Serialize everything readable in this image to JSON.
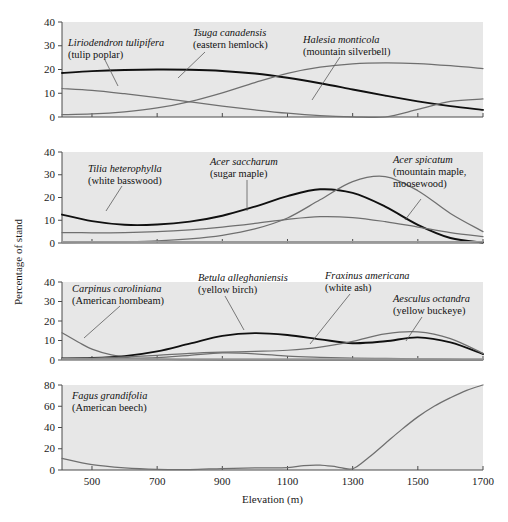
{
  "figure": {
    "xlabel": "Elevation (m)",
    "ylabel": "Percentage of stand"
  },
  "chart_data": {
    "type": "line",
    "title": "",
    "xlabel": "Elevation (m)",
    "ylabel": "Percentage of stand",
    "xlim": [
      408,
      1700
    ],
    "xticks": [
      500,
      700,
      900,
      1100,
      1300,
      1500,
      1700
    ],
    "grid": false,
    "legend_position": "inline-annotations",
    "panels": [
      {
        "index": 1,
        "ylim": [
          0,
          40
        ],
        "yticks": [
          0,
          10,
          20,
          30,
          40
        ],
        "series": [
          {
            "name": "Liriodendron tulipifera",
            "common": "tulip poplar",
            "style": "thick-black",
            "x": [
              408,
              500,
              600,
              700,
              800,
              900,
              1000,
              1100,
              1200,
              1300,
              1400,
              1500,
              1600,
              1700
            ],
            "values": [
              18.5,
              19.3,
              19.8,
              20.0,
              19.9,
              19.4,
              18.3,
              16.5,
              14.2,
              11.6,
              9.0,
              6.6,
              4.6,
              3.0
            ]
          },
          {
            "name": "Tsuga canadensis",
            "common": "eastern hemlock",
            "style": "thin-gray",
            "x": [
              408,
              500,
              600,
              700,
              800,
              900,
              1000,
              1100,
              1200,
              1300,
              1400,
              1500,
              1600,
              1700
            ],
            "values": [
              1.0,
              1.3,
              2.2,
              3.8,
              6.5,
              10.2,
              14.5,
              18.4,
              21.0,
              22.4,
              22.8,
              22.5,
              21.6,
              20.4
            ]
          },
          {
            "name": "Halesia monticola",
            "common": "mountain silverbell",
            "style": "thin-gray",
            "x": [
              408,
              500,
              600,
              700,
              800,
              900,
              1000,
              1100,
              1200,
              1300,
              1400,
              1500,
              1600,
              1700
            ],
            "values": [
              12.0,
              11.2,
              9.8,
              8.2,
              6.4,
              4.6,
              3.0,
              1.6,
              0.6,
              0.1,
              0.0,
              3.2,
              6.6,
              7.6
            ]
          }
        ]
      },
      {
        "index": 2,
        "ylim": [
          0,
          40
        ],
        "yticks": [
          0,
          10,
          20,
          30,
          40
        ],
        "series": [
          {
            "name": "Tilia heterophylla",
            "common": "white basswood",
            "style": "thick-black",
            "x": [
              408,
              500,
              600,
              700,
              800,
              900,
              1000,
              1100,
              1200,
              1300,
              1400,
              1500,
              1600,
              1700
            ],
            "values": [
              12.5,
              9.6,
              8.0,
              8.1,
              9.4,
              12.0,
              16.0,
              20.6,
              23.6,
              22.0,
              16.0,
              8.0,
              2.2,
              0.2
            ]
          },
          {
            "name": "Acer saccharum",
            "common": "sugar maple",
            "style": "thin-gray",
            "x": [
              408,
              500,
              600,
              700,
              800,
              900,
              1000,
              1100,
              1200,
              1300,
              1400,
              1500,
              1600,
              1700
            ],
            "values": [
              4.6,
              4.5,
              4.6,
              5.0,
              5.8,
              7.0,
              8.6,
              10.4,
              11.6,
              11.2,
              9.4,
              7.0,
              4.6,
              2.8
            ]
          },
          {
            "name": "Acer spicatum",
            "common": "mountain maple, moosewood",
            "style": "thin-gray",
            "x": [
              408,
              500,
              600,
              700,
              800,
              900,
              1000,
              1100,
              1200,
              1300,
              1400,
              1500,
              1600,
              1700
            ],
            "values": [
              0.2,
              0.3,
              0.5,
              0.9,
              1.8,
              3.4,
              6.2,
              11.0,
              19.0,
              27.0,
              29.2,
              23.0,
              13.0,
              5.0
            ]
          },
          {
            "name": "baseline-species",
            "common": "",
            "style": "flat-gray",
            "x": [
              408,
              900,
              1300,
              1700
            ],
            "values": [
              0.5,
              0.5,
              0.5,
              0.5
            ]
          }
        ]
      },
      {
        "index": 3,
        "ylim": [
          0,
          40
        ],
        "yticks": [
          0,
          10,
          20,
          30,
          40
        ],
        "series": [
          {
            "name": "Carpinus caroliniana",
            "common": "American hornbeam",
            "style": "thin-gray",
            "x": [
              408,
              460,
              500,
              560,
              620,
              700,
              800,
              900,
              1000,
              1100,
              1300,
              1500,
              1700
            ],
            "values": [
              14.0,
              9.0,
              5.6,
              2.6,
              1.0,
              0.4,
              0.2,
              0.1,
              0.1,
              0.1,
              0.1,
              0.1,
              0.1
            ]
          },
          {
            "name": "Betula alleghaniensis",
            "common": "yellow birch",
            "style": "thick-black",
            "x": [
              408,
              500,
              600,
              700,
              800,
              900,
              1000,
              1100,
              1200,
              1300,
              1400,
              1500,
              1600,
              1700
            ],
            "values": [
              0.8,
              1.0,
              2.0,
              4.4,
              8.4,
              12.4,
              13.8,
              12.8,
              10.6,
              8.6,
              9.6,
              11.6,
              9.0,
              3.0
            ]
          },
          {
            "name": "Fraxinus americana",
            "common": "white ash",
            "style": "thin-gray",
            "x": [
              408,
              500,
              600,
              700,
              800,
              900,
              1000,
              1100,
              1200,
              1300,
              1400,
              1500,
              1600,
              1700
            ],
            "values": [
              0.8,
              1.0,
              1.6,
              2.4,
              3.4,
              4.0,
              4.4,
              5.0,
              6.6,
              9.6,
              13.4,
              14.4,
              11.0,
              3.4
            ]
          },
          {
            "name": "Aesculus octandra",
            "common": "yellow buckeye",
            "style": "thin-gray",
            "x": [
              408,
              500,
              600,
              700,
              800,
              900,
              1000,
              1100,
              1200,
              1300,
              1400,
              1500,
              1600,
              1700
            ],
            "values": [
              0.5,
              0.6,
              0.8,
              1.2,
              2.4,
              3.6,
              3.2,
              2.0,
              1.4,
              1.0,
              0.8,
              0.6,
              0.4,
              0.3
            ]
          },
          {
            "name": "baseline-species",
            "common": "",
            "style": "flat-gray",
            "x": [
              408,
              900,
              1300,
              1700
            ],
            "values": [
              0.5,
              0.5,
              0.5,
              0.5
            ]
          }
        ]
      },
      {
        "index": 4,
        "ylim": [
          0,
          80
        ],
        "yticks": [
          0,
          20,
          40,
          60,
          80
        ],
        "series": [
          {
            "name": "Fagus grandifolia",
            "common": "American beech",
            "style": "thin-gray",
            "x": [
              408,
              500,
              600,
              700,
              800,
              900,
              1000,
              1100,
              1150,
              1200,
              1250,
              1300,
              1350,
              1400,
              1450,
              1500,
              1550,
              1600,
              1650,
              1700
            ],
            "values": [
              11.0,
              5.0,
              2.0,
              0.6,
              0.4,
              1.4,
              2.0,
              2.2,
              4.2,
              4.6,
              3.0,
              1.2,
              12.0,
              25.0,
              38.0,
              50.0,
              60.0,
              68.0,
              75.0,
              80.0
            ]
          }
        ]
      }
    ],
    "annotations": [
      {
        "panel": 1,
        "sci": "Liriodendron tulipifera",
        "common": "(tulip poplar)"
      },
      {
        "panel": 1,
        "sci": "Tsuga canadensis",
        "common": "(eastern hemlock)"
      },
      {
        "panel": 1,
        "sci": "Halesia monticola",
        "common": "(mountain silverbell)"
      },
      {
        "panel": 2,
        "sci": "Tilia heterophylla",
        "common": "(white basswood)"
      },
      {
        "panel": 2,
        "sci": "Acer saccharum",
        "common": "(sugar maple)"
      },
      {
        "panel": 2,
        "sci": "Acer spicatum",
        "common": "(mountain maple,"
      },
      {
        "panel": 2,
        "sci": "",
        "common": "moosewood)"
      },
      {
        "panel": 3,
        "sci": "Carpinus caroliniana",
        "common": "(American hornbeam)"
      },
      {
        "panel": 3,
        "sci": "Betula alleghaniensis",
        "common": "(yellow birch)"
      },
      {
        "panel": 3,
        "sci": "Fraxinus americana",
        "common": "(white ash)"
      },
      {
        "panel": 3,
        "sci": "Aesculus octandra",
        "common": "(yellow buckeye)"
      },
      {
        "panel": 4,
        "sci": "Fagus grandifolia",
        "common": "(American beech)"
      }
    ]
  },
  "ticklabels": {
    "x": [
      "500",
      "700",
      "900",
      "1100",
      "1300",
      "1500",
      "1700"
    ],
    "y40": [
      "0",
      "10",
      "20",
      "30",
      "40"
    ],
    "y80": [
      "0",
      "20",
      "40",
      "60",
      "80"
    ]
  }
}
